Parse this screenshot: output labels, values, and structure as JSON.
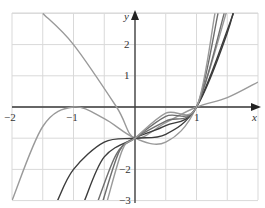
{
  "chart_data": {
    "type": "line",
    "title": "",
    "xlabel": "x",
    "ylabel": "y",
    "xlim": [
      -2,
      2
    ],
    "ylim": [
      -3,
      3
    ],
    "grid": true,
    "x_ticks": [
      -2,
      -1,
      1
    ],
    "x_tick_labels": [
      "−2",
      "−1",
      "1"
    ],
    "y_ticks": [
      2,
      1,
      -2,
      -3
    ],
    "y_tick_labels": [
      "2",
      "1",
      "−2",
      "−3"
    ],
    "common_points": [
      [
        0,
        -1
      ],
      [
        1,
        0
      ]
    ],
    "series": [
      {
        "name": "curve-1",
        "shade": "light",
        "description": "cubic with double root at x=-1",
        "formula": "(x+1)^2 (x-1)",
        "points": [
          [
            -2,
            -3
          ],
          [
            -1.5,
            -0.625
          ],
          [
            -1,
            0
          ],
          [
            -0.5,
            -0.375
          ],
          [
            0,
            -1
          ],
          [
            0.5,
            -1.125
          ],
          [
            1,
            0
          ],
          [
            1.5,
            3.125
          ]
        ]
      },
      {
        "name": "curve-2",
        "shade": "light",
        "description": "descending from upper left, min near x=0.5, tangent to x-axis at x=1",
        "points": [
          [
            -1.5,
            3
          ],
          [
            -1,
            2
          ],
          [
            -0.3,
            0
          ],
          [
            0,
            -1
          ],
          [
            0.5,
            -0.5
          ],
          [
            1,
            0
          ],
          [
            1.5,
            0.3
          ],
          [
            2,
            0.8
          ]
        ]
      },
      {
        "name": "curve-3",
        "shade": "dark",
        "formula": "x^3 - 1",
        "points": [
          [
            -1.26,
            -3
          ],
          [
            -1,
            -2
          ],
          [
            -0.5,
            -1.125
          ],
          [
            0,
            -1
          ],
          [
            0.5,
            -0.875
          ],
          [
            1,
            0
          ],
          [
            1.5,
            2.375
          ],
          [
            1.71,
            4
          ]
        ]
      },
      {
        "name": "curve-4",
        "shade": "dark",
        "points": [
          [
            -0.82,
            -3
          ],
          [
            -0.5,
            -1.6
          ],
          [
            0,
            -1
          ],
          [
            0.5,
            -0.6
          ],
          [
            1,
            0
          ],
          [
            1.6,
            3
          ]
        ]
      },
      {
        "name": "curve-5",
        "shade": "medium",
        "points": [
          [
            -0.6,
            -3
          ],
          [
            -0.3,
            -1.5
          ],
          [
            0,
            -1
          ],
          [
            0.5,
            -0.45
          ],
          [
            1,
            0
          ],
          [
            1.45,
            3
          ]
        ]
      },
      {
        "name": "curve-6",
        "shade": "medium",
        "points": [
          [
            -0.52,
            -3
          ],
          [
            -0.25,
            -1.4
          ],
          [
            0,
            -1
          ],
          [
            0.5,
            -0.3
          ],
          [
            1,
            0
          ],
          [
            1.35,
            3
          ]
        ]
      },
      {
        "name": "curve-7",
        "shade": "light",
        "points": [
          [
            -0.45,
            -3
          ],
          [
            -0.2,
            -1.35
          ],
          [
            0,
            -1
          ],
          [
            0.5,
            -0.2
          ],
          [
            1,
            0
          ],
          [
            1.3,
            3
          ]
        ]
      }
    ]
  },
  "axes": {
    "x_label": "x",
    "y_label": "y",
    "x_tick_labels": [
      "−2",
      "−1",
      "1"
    ],
    "y_tick_labels": [
      "2",
      "1",
      "−2",
      "−3"
    ]
  },
  "colors": {
    "grid": "#d9d9d9",
    "axis": "#3a3a3a",
    "dark": "#3c3c3c",
    "medium": "#6e6e6e",
    "light": "#9a9a9a"
  }
}
